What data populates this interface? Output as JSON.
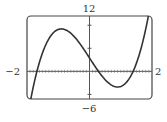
{
  "chart_data": {
    "type": "line",
    "title": "",
    "xlabel": "",
    "ylabel": "",
    "xlim": [
      -2,
      2
    ],
    "ylim": [
      -6,
      12
    ],
    "tick_labels": {
      "xmin": "−2",
      "xmax": "2",
      "ymax": "12",
      "ymin": "−6"
    },
    "y_ticks": [
      -5,
      5,
      10
    ],
    "x_tick_step": 0.1,
    "grid": false,
    "legend": "none",
    "series": [
      {
        "name": "f(x)",
        "approx_formula": "f(x) ≈ 4.3x^3 − 10.5x + 2.9",
        "x": [
          -2.0,
          -1.9,
          -1.8,
          -1.74,
          -1.6,
          -1.4,
          -1.2,
          -1.0,
          -0.9,
          -0.8,
          -0.6,
          -0.4,
          -0.2,
          0.0,
          0.21,
          0.4,
          0.6,
          0.8,
          0.9,
          1.0,
          1.2,
          1.39,
          1.6,
          1.8,
          1.9,
          2.0
        ],
        "y": [
          -10.7,
          -7.7,
          -4.9,
          -0.4,
          2.0,
          5.7,
          8.0,
          9.1,
          9.2,
          9.1,
          8.2,
          6.8,
          5.0,
          2.9,
          0.7,
          -0.9,
          -2.4,
          -3.3,
          -3.4,
          -3.3,
          -2.2,
          0.0,
          3.7,
          7.2,
          12.5,
          16.5
        ],
        "color": "#333333"
      }
    ]
  }
}
